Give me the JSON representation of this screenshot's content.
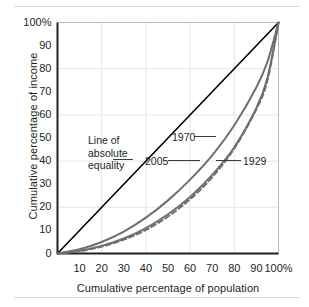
{
  "figure": {
    "name": "lorenz-curve-figure",
    "top_rule": true,
    "bottom_rule": true
  },
  "chart_data": {
    "type": "line",
    "title": "",
    "xlabel": "Cumulative percentage of population",
    "ylabel": "Cumulative percentage of income",
    "xlim": [
      0,
      100
    ],
    "ylim": [
      0,
      100
    ],
    "grid": true,
    "grid_interval": 20,
    "xticks": [
      "10",
      "20",
      "30",
      "40",
      "50",
      "60",
      "70",
      "80",
      "90",
      "100%"
    ],
    "xtick_values": [
      10,
      20,
      30,
      40,
      50,
      60,
      70,
      80,
      90,
      100
    ],
    "yticks": [
      "0",
      "10",
      "20",
      "30",
      "40",
      "50",
      "60",
      "70",
      "80",
      "90",
      "100%"
    ],
    "ytick_values": [
      0,
      10,
      20,
      30,
      40,
      50,
      60,
      70,
      80,
      90,
      100
    ],
    "legend_position": "inline-annotations",
    "x": [
      0,
      10,
      20,
      30,
      40,
      50,
      60,
      70,
      80,
      90,
      95,
      100
    ],
    "series": [
      {
        "name": "Line of absolute equality",
        "style": "solid",
        "color": "#000000",
        "width": 1.6,
        "values": [
          0,
          10,
          20,
          30,
          40,
          50,
          60,
          70,
          80,
          90,
          95,
          100
        ]
      },
      {
        "name": "1970",
        "style": "solid",
        "color": "#6e6e73",
        "width": 2.0,
        "values": [
          0,
          1.8,
          5.0,
          9.5,
          15.5,
          23.0,
          32.0,
          42.5,
          55.5,
          72.0,
          83.0,
          100
        ]
      },
      {
        "name": "2005",
        "style": "solid",
        "color": "#6e6e73",
        "width": 2.0,
        "values": [
          0,
          1.2,
          3.3,
          6.5,
          11.0,
          17.0,
          24.5,
          34.0,
          46.0,
          63.0,
          76.0,
          100
        ]
      },
      {
        "name": "1929",
        "style": "dashed",
        "color": "#6e6e73",
        "width": 2.0,
        "values": [
          0,
          1.0,
          3.0,
          6.0,
          10.2,
          16.0,
          23.5,
          33.0,
          45.5,
          62.5,
          75.0,
          100
        ]
      }
    ],
    "annotations": [
      {
        "text_lines": [
          "Line of",
          "absolute",
          "equality"
        ],
        "target": "equality-line"
      },
      {
        "text": "1970",
        "target": "1970-curve"
      },
      {
        "text": "2005",
        "target": "2005-curve"
      },
      {
        "text": "1929",
        "target": "1929-curve"
      }
    ]
  },
  "annotation_text": {
    "equality_line1": "Line of",
    "equality_line2": "absolute",
    "equality_line3": "equality",
    "y1970": "1970",
    "y2005": "2005",
    "y1929": "1929"
  },
  "axis_colors": {
    "axis": "#231f20",
    "grid": "#e6e6ea",
    "curve": "#6e6e73",
    "equality": "#000000",
    "rule": "#d9d9dc"
  }
}
